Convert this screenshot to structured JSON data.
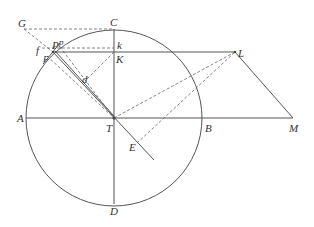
{
  "diagram": {
    "type": "geometric-construction",
    "circle": {
      "center_label": "T",
      "cx": 114,
      "cy": 118,
      "r": 88
    },
    "points": {
      "G": {
        "label": "G",
        "x": 24,
        "y": 29
      },
      "C": {
        "label": "C",
        "x": 114,
        "y": 29
      },
      "k": {
        "label": "k",
        "x": 114,
        "y": 48
      },
      "K": {
        "label": "K",
        "x": 114,
        "y": 52
      },
      "P": {
        "label": "P",
        "x": 53,
        "y": 52
      },
      "p": {
        "label": "p",
        "x": 60,
        "y": 47
      },
      "f": {
        "label": "f",
        "x": 42,
        "y": 49
      },
      "F": {
        "label": "F",
        "x": 47,
        "y": 58
      },
      "d": {
        "label": "d",
        "x": 86,
        "y": 80
      },
      "L": {
        "label": "L",
        "x": 235,
        "y": 52
      },
      "A": {
        "label": "A",
        "x": 26,
        "y": 118
      },
      "T": {
        "label": "T",
        "x": 114,
        "y": 118
      },
      "B": {
        "label": "B",
        "x": 203,
        "y": 118
      },
      "M": {
        "label": "M",
        "x": 293,
        "y": 118
      },
      "E": {
        "label": "E",
        "x": 137,
        "y": 143
      },
      "D": {
        "label": "D",
        "x": 114,
        "y": 204
      }
    },
    "labels": {
      "G": "G",
      "C": "C",
      "k": "k",
      "K": "K",
      "P": "P",
      "p": "p",
      "f": "f",
      "F": "F",
      "d": "d",
      "L": "L",
      "A": "A",
      "T": "T",
      "B": "B",
      "M": "M",
      "E": "E",
      "D": "D"
    },
    "solid_segments": [
      "AM",
      "CD",
      "PL",
      "LM",
      "P-T-E extended"
    ],
    "dashed_segments": [
      "GC",
      "GP",
      "pk",
      "Kd",
      "dT",
      "PT",
      "FT",
      "TL",
      "EL"
    ],
    "colors": {
      "stroke": "#555555",
      "dash": "#666666",
      "text": "#333333",
      "background": "#ffffff"
    }
  }
}
